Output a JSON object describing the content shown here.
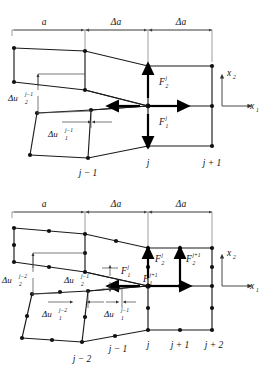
{
  "figure": {
    "panels": [
      {
        "id": "top-panel",
        "name": "linear-element-panel",
        "dimensions": [
          {
            "label": "a",
            "symbol": "a"
          },
          {
            "label": "Δa",
            "symbol": "Δa"
          },
          {
            "label": "Δa",
            "symbol": "Δa"
          }
        ],
        "node_labels": [
          "j − 1",
          "j",
          "j + 1"
        ],
        "forces": [
          {
            "name": "F2j",
            "base": "F",
            "sub": "2",
            "sup": "j",
            "direction": "vertical"
          },
          {
            "name": "F1j",
            "base": "F",
            "sub": "1",
            "sup": "j",
            "direction": "horizontal"
          }
        ],
        "displacements": [
          {
            "name": "du2-jm1",
            "base": "Δu",
            "sub": "2",
            "sup": "j−1",
            "direction": "vertical"
          },
          {
            "name": "du1-jm1",
            "base": "Δu",
            "sub": "1",
            "sup": "j−1",
            "direction": "horizontal"
          }
        ],
        "axes": [
          {
            "base": "x",
            "sub": "2",
            "direction": "vertical"
          },
          {
            "base": "x",
            "sub": "1",
            "direction": "horizontal"
          }
        ]
      },
      {
        "id": "bottom-panel",
        "name": "quadratic-element-panel",
        "dimensions": [
          {
            "label": "a",
            "symbol": "a"
          },
          {
            "label": "Δa",
            "symbol": "Δa"
          },
          {
            "label": "Δa",
            "symbol": "Δa"
          }
        ],
        "node_labels": [
          "j − 2",
          "j − 1",
          "j",
          "j + 1",
          "j + 2"
        ],
        "forces": [
          {
            "name": "F2j",
            "base": "F",
            "sub": "2",
            "sup": "j",
            "direction": "vertical"
          },
          {
            "name": "F1j",
            "base": "F",
            "sub": "1",
            "sup": "j",
            "direction": "horizontal"
          },
          {
            "name": "F2jp1",
            "base": "F",
            "sub": "2",
            "sup": "j+1",
            "direction": "vertical"
          },
          {
            "name": "F1jp1",
            "base": "F",
            "sub": "1",
            "sup": "j+1",
            "direction": "horizontal"
          }
        ],
        "displacements": [
          {
            "name": "du2-jm2",
            "base": "Δu",
            "sub": "2",
            "sup": "j−2",
            "direction": "vertical"
          },
          {
            "name": "du2-jm1",
            "base": "Δu",
            "sub": "2",
            "sup": "j−1",
            "direction": "vertical"
          },
          {
            "name": "du1-jm2",
            "base": "Δu",
            "sub": "1",
            "sup": "j−2",
            "direction": "horizontal"
          },
          {
            "name": "du1-jm1",
            "base": "Δu",
            "sub": "1",
            "sup": "j−1",
            "direction": "horizontal"
          }
        ],
        "axes": [
          {
            "base": "x",
            "sub": "2",
            "direction": "vertical"
          },
          {
            "base": "x",
            "sub": "1",
            "direction": "horizontal"
          }
        ]
      }
    ],
    "colors": {
      "mesh_line": "#1a1a1a",
      "dimension_line": "#555555",
      "force_arrow": "#000000",
      "node": "#111111",
      "background": "#ffffff"
    }
  }
}
